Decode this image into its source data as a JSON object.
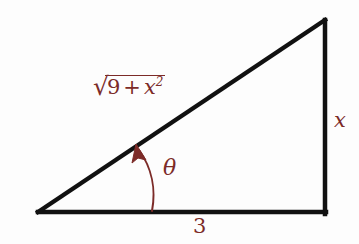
{
  "figure": {
    "kind": "right-triangle-trigonometry-diagram",
    "background_color": "#fdfdfd",
    "stroke_color": "#111111",
    "label_color": "#7c2b28",
    "width": 359,
    "height": 244
  },
  "triangle": {
    "vertices": {
      "bottom_left": {
        "x": 38,
        "y": 212
      },
      "bottom_right": {
        "x": 325,
        "y": 212
      },
      "top_right": {
        "x": 325,
        "y": 20
      }
    },
    "stroke_width": 4.5,
    "sides": {
      "base_label": "3",
      "opposite_label": "x",
      "hypotenuse_label": "√(9 + x²)"
    }
  },
  "labels": {
    "hypotenuse": {
      "radical_sign": "√",
      "radicand_first": "9",
      "operator": "+",
      "radicand_var": "x",
      "radicand_exponent": "2"
    },
    "angle": {
      "symbol": "θ",
      "name": "theta"
    },
    "base": {
      "value": "3"
    },
    "opposite": {
      "value": "x"
    }
  },
  "angle_arrow": {
    "from": {
      "x": 152,
      "y": 211
    },
    "to": {
      "x": 137,
      "y": 146
    },
    "control": {
      "x": 160,
      "y": 175
    },
    "color": "#7c2b28",
    "stroke_width": 2,
    "arrowhead": "filled-triangle"
  }
}
